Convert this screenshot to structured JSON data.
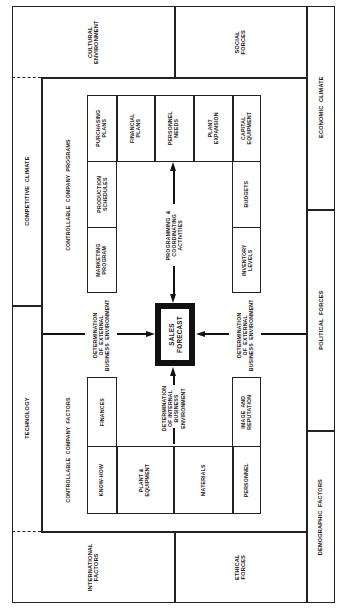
{
  "diagram": {
    "orientation": "rotated 90 degrees counter-clockwise",
    "center": {
      "label": "SALES\nFORECAST"
    },
    "external_environment": {
      "top_left": "CULTURAL\nENVIRONMENT",
      "top_right": "SOCIAL\nFORCES",
      "bottom_left": "INTERNATIONAL\nFACTORS",
      "bottom_right": "ETHICAL\nFORCES",
      "left_upper": "COMPETITIVE  CLIMATE",
      "left_lower": "TECHNOLOGY",
      "right_upper": "ECONOMIC  CLIMATE",
      "right_middle": "POLITICAL  FORCES",
      "right_lower": "DEMOGRAPHIC  FACTORS"
    },
    "programs": {
      "heading": "CONTROLLABLE  COMPANY  PROGRAMS",
      "top_row": [
        "PURCHASING\nPLANS",
        "FINANCIAL\nPLANS",
        "PERSONNEL\nNEEDS",
        "PLANT\nEXPANSION",
        "CAPITAL\nEQUIPMENT"
      ],
      "left_column": [
        "PRODUCTION\nSCHEDULES",
        "MARKETING\nPROGRAM"
      ],
      "right_column": [
        "BUDGETS",
        "INVENTORY\nLEVELS"
      ],
      "arrow_label": "PROGRAMMING  &\nCOORDINATING\nACTIVITIES"
    },
    "factors": {
      "heading": "CONTROLLABLE  COMPANY  FACTORS",
      "upper_left": "FINANCES",
      "upper_right": "IMAGE  AND\nREPUTATION",
      "bottom_row": [
        "KNOW-HOW",
        "PLANT &\nEQUIPMENT",
        "MATERIALS",
        "PERSONNEL"
      ],
      "arrow_label": "DETERMINATION\nOF INTERNAL\nBUSINESS\nENVIRONMENT"
    },
    "external_arrows": {
      "left_label": "DETERMINATION\nOF  EXTERNAL\nBUSINESS  ENVIRONMENT",
      "right_label": "DETERMINATION\nOF  EXTERNAL\nBUSINESS  ENVIRONMENT"
    },
    "colors": {
      "line": "#222222",
      "background": "#ffffff"
    }
  }
}
